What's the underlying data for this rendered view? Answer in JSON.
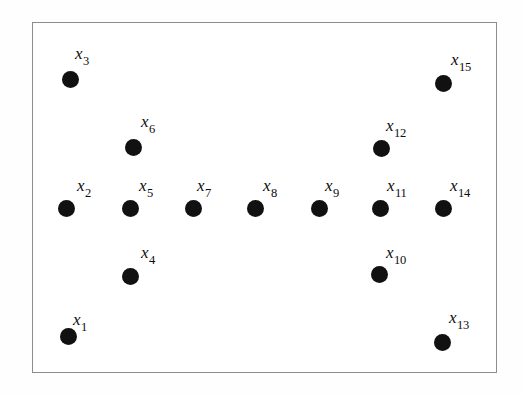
{
  "figure": {
    "kind": "scatter-diagram",
    "background_color": "#ffffff",
    "frame": {
      "border_color": "#8d8d8d",
      "border_width_px": 1,
      "x": 32,
      "y": 22,
      "width": 465,
      "height": 351
    },
    "marker": {
      "shape": "filled-circle",
      "color": "#111111",
      "diameter_px": 17
    },
    "label_style": {
      "color": "#0d0d0d",
      "base_font_size_px": 17,
      "subscript_font_size_px": 12.5,
      "italic_base": true
    }
  },
  "chart_data": {
    "type": "scatter",
    "title": "",
    "xlabel": "",
    "ylabel": "",
    "grid": false,
    "legend": null,
    "axes_visible": false,
    "xlim": [
      32,
      497
    ],
    "ylim": [
      22,
      373
    ],
    "point_count": 15,
    "series": [
      {
        "name": "points",
        "marker": "filled-circle",
        "color": "#111111",
        "points": [
          {
            "id": "x1",
            "base": "x",
            "sub": "1",
            "label": "x₁",
            "x": 67,
            "y": 335,
            "label_x": 72,
            "label_y": 310
          },
          {
            "id": "x2",
            "base": "x",
            "sub": "2",
            "label": "x₂",
            "x": 65,
            "y": 207,
            "label_x": 76,
            "label_y": 176
          },
          {
            "id": "x3",
            "base": "x",
            "sub": "3",
            "label": "x₃",
            "x": 69,
            "y": 78,
            "label_x": 74,
            "label_y": 44
          },
          {
            "id": "x4",
            "base": "x",
            "sub": "4",
            "label": "x₄",
            "x": 129,
            "y": 275,
            "label_x": 140,
            "label_y": 243
          },
          {
            "id": "x5",
            "base": "x",
            "sub": "5",
            "label": "x₅",
            "x": 129,
            "y": 207,
            "label_x": 138,
            "label_y": 176
          },
          {
            "id": "x6",
            "base": "x",
            "sub": "6",
            "label": "x₆",
            "x": 132,
            "y": 146,
            "label_x": 140,
            "label_y": 112
          },
          {
            "id": "x7",
            "base": "x",
            "sub": "7",
            "label": "x₇",
            "x": 192,
            "y": 207,
            "label_x": 196,
            "label_y": 176
          },
          {
            "id": "x8",
            "base": "x",
            "sub": "8",
            "label": "x₈",
            "x": 254,
            "y": 207,
            "label_x": 262,
            "label_y": 176
          },
          {
            "id": "x9",
            "base": "x",
            "sub": "9",
            "label": "x₉",
            "x": 318,
            "y": 207,
            "label_x": 324,
            "label_y": 176
          },
          {
            "id": "x10",
            "base": "x",
            "sub": "10",
            "label": "x₁₀",
            "x": 378,
            "y": 273,
            "label_x": 385,
            "label_y": 243
          },
          {
            "id": "x11",
            "base": "x",
            "sub": "11",
            "label": "x₁₁",
            "x": 379,
            "y": 207,
            "label_x": 386,
            "label_y": 176
          },
          {
            "id": "x12",
            "base": "x",
            "sub": "12",
            "label": "x₁₂",
            "x": 380,
            "y": 147,
            "label_x": 385,
            "label_y": 116
          },
          {
            "id": "x13",
            "base": "x",
            "sub": "13",
            "label": "x₁₃",
            "x": 441,
            "y": 341,
            "label_x": 448,
            "label_y": 308
          },
          {
            "id": "x14",
            "base": "x",
            "sub": "14",
            "label": "x₁₄",
            "x": 442,
            "y": 207,
            "label_x": 449,
            "label_y": 176
          },
          {
            "id": "x15",
            "base": "x",
            "sub": "15",
            "label": "x₁₅",
            "x": 442,
            "y": 82,
            "label_x": 450,
            "label_y": 50
          }
        ]
      }
    ]
  }
}
